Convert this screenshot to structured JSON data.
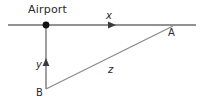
{
  "figure": {
    "background_color": "#ffffff",
    "line_color": "#6e6e6e",
    "text_color": "#2b2b2b",
    "width": 203,
    "height": 105
  },
  "labels": {
    "airport": "Airport",
    "x": "x",
    "y": "y",
    "z": "z",
    "point_a": "A",
    "point_b": "B"
  },
  "geometry": {
    "horizontal_line": {
      "x1": 8,
      "y1": 25,
      "x2": 196,
      "y2": 25
    },
    "vertical_line": {
      "x1": 46,
      "y1": 25,
      "x2": 46,
      "y2": 89
    },
    "diagonal_line": {
      "x1": 46,
      "y1": 89,
      "x2": 173,
      "y2": 26
    },
    "airport_point": {
      "cx": 46,
      "cy": 25,
      "r": 3
    },
    "x_arrow": {
      "x": 113,
      "y": 25,
      "direction": "right"
    },
    "y_arrow": {
      "x": 46,
      "y": 62,
      "direction": "up"
    }
  }
}
